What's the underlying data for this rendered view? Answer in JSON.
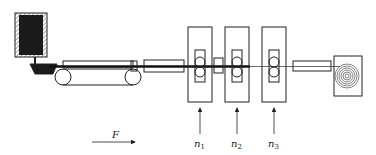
{
  "diagram": {
    "type": "continuous casting and rolling process schematic",
    "components": [
      {
        "id": "ladle",
        "label": "tundish / ladle"
      },
      {
        "id": "caster",
        "label": "belt caster"
      },
      {
        "id": "guide",
        "label": "entry guide"
      },
      {
        "id": "stand1",
        "label": "rolling stand 1"
      },
      {
        "id": "stand2",
        "label": "rolling stand 2"
      },
      {
        "id": "stand3",
        "label": "rolling stand 3"
      },
      {
        "id": "exit_guide",
        "label": "exit guide"
      },
      {
        "id": "coiler",
        "label": "coiler"
      }
    ],
    "labels": {
      "force": "F",
      "n1_base": "n",
      "n1_sub": "1",
      "n2_base": "n",
      "n2_sub": "2",
      "n3_base": "n",
      "n3_sub": "3"
    },
    "colors": {
      "line": "#222222",
      "fill_dark": "#1a1a1a",
      "background": "#ffffff"
    }
  }
}
